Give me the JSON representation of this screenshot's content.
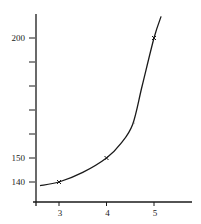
{
  "chart_data": {
    "type": "line",
    "title": "",
    "xlabel": "",
    "ylabel": "",
    "xlim": [
      2.6,
      5.8
    ],
    "ylim": [
      138,
      215
    ],
    "grid": false,
    "legend": null,
    "x_ticks": [
      3,
      4,
      5
    ],
    "x_tick_labels": [
      "3",
      "4",
      "5"
    ],
    "y_ticks": [
      140,
      150,
      160,
      170,
      180,
      190,
      200
    ],
    "y_tick_labels": [
      "140",
      "150",
      "",
      "",
      "",
      "",
      "200"
    ],
    "series": [
      {
        "name": "smooth curve",
        "style": "line",
        "x": [
          2.6,
          3.0,
          3.5,
          4.0,
          4.3,
          4.55,
          4.75,
          5.0,
          5.15
        ],
        "y": [
          138.5,
          140,
          144,
          150,
          156,
          164,
          180,
          200,
          209
        ]
      },
      {
        "name": "marked points",
        "style": "cross-markers",
        "x": [
          3,
          4,
          5
        ],
        "y": [
          140,
          150,
          200
        ]
      }
    ],
    "colors": {
      "line": "#1a1a1a",
      "axis": "#1a1a1a",
      "background": "#ffffff"
    }
  }
}
